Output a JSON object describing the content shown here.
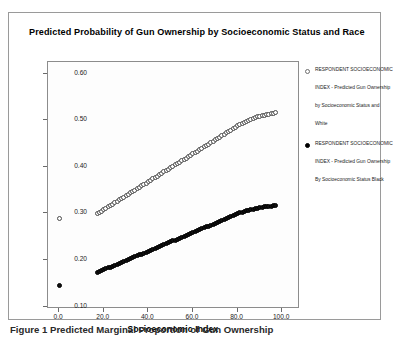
{
  "figure": {
    "title": "Predicted Probability of Gun Ownership by Socioeconomic Status and Race",
    "caption": "Figure 1 Predicted Marginal Proportion of Gun Ownership"
  },
  "legend": {
    "entries": [
      {
        "marker": "open-circle",
        "label": "RESPONDENT SOCIOECONOMIC INDEX - Predicted Gun Ownership by Socioeconomic Status and White"
      },
      {
        "marker": "filled-circle",
        "label": "RESPONDENT SOCIOECONOMIC INDEX - Predicted Gun Ownership By Socioeconomic Status Black"
      }
    ]
  },
  "chart_data": {
    "type": "scatter",
    "title": "Predicted Probability of Gun Ownership by Socioeconomic Status and Race",
    "xlabel": "Socioeconomic Index",
    "ylabel": "",
    "xlim": [
      -5,
      108
    ],
    "ylim": [
      0.095,
      0.625
    ],
    "grid": false,
    "legend_position": "right",
    "xticks": [
      "0.0",
      "20.0",
      "40.0",
      "60.0",
      "80.0",
      "100.0"
    ],
    "xtick_values": [
      0,
      20,
      40,
      60,
      80,
      100
    ],
    "yticks": [
      "0.10",
      "0.20",
      "0.30",
      "0.40",
      "0.50",
      "0.60"
    ],
    "ytick_values": [
      0.1,
      0.2,
      0.3,
      0.4,
      0.5,
      0.6
    ],
    "series": [
      {
        "name": "White - Predicted Gun Ownership by Socioeconomic Status",
        "marker": "open-circle",
        "color": "#ffffff",
        "edge_color": "#4a4a4a",
        "points": [
          [
            0,
            0.29
          ],
          [
            17,
            0.299
          ],
          [
            18,
            0.302
          ],
          [
            19,
            0.305
          ],
          [
            20,
            0.308
          ],
          [
            21,
            0.311
          ],
          [
            22,
            0.314
          ],
          [
            23,
            0.317
          ],
          [
            24,
            0.32
          ],
          [
            25,
            0.323
          ],
          [
            26,
            0.326
          ],
          [
            27,
            0.329
          ],
          [
            28,
            0.332
          ],
          [
            29,
            0.335
          ],
          [
            30,
            0.338
          ],
          [
            31,
            0.341
          ],
          [
            32,
            0.344
          ],
          [
            33,
            0.347
          ],
          [
            34,
            0.35
          ],
          [
            35,
            0.353
          ],
          [
            36,
            0.356
          ],
          [
            37,
            0.359
          ],
          [
            38,
            0.362
          ],
          [
            39,
            0.365
          ],
          [
            40,
            0.368
          ],
          [
            41,
            0.371
          ],
          [
            42,
            0.374
          ],
          [
            43,
            0.377
          ],
          [
            44,
            0.38
          ],
          [
            45,
            0.383
          ],
          [
            46,
            0.386
          ],
          [
            47,
            0.389
          ],
          [
            48,
            0.392
          ],
          [
            49,
            0.395
          ],
          [
            50,
            0.398
          ],
          [
            51,
            0.401
          ],
          [
            52,
            0.404
          ],
          [
            53,
            0.407
          ],
          [
            54,
            0.41
          ],
          [
            55,
            0.413
          ],
          [
            56,
            0.416
          ],
          [
            57,
            0.419
          ],
          [
            58,
            0.422
          ],
          [
            59,
            0.425
          ],
          [
            60,
            0.428
          ],
          [
            61,
            0.431
          ],
          [
            62,
            0.434
          ],
          [
            63,
            0.437
          ],
          [
            64,
            0.44
          ],
          [
            65,
            0.443
          ],
          [
            66,
            0.446
          ],
          [
            67,
            0.449
          ],
          [
            68,
            0.452
          ],
          [
            69,
            0.455
          ],
          [
            70,
            0.458
          ],
          [
            71,
            0.461
          ],
          [
            72,
            0.464
          ],
          [
            73,
            0.467
          ],
          [
            74,
            0.47
          ],
          [
            75,
            0.473
          ],
          [
            76,
            0.476
          ],
          [
            77,
            0.479
          ],
          [
            78,
            0.482
          ],
          [
            79,
            0.485
          ],
          [
            80,
            0.488
          ],
          [
            81,
            0.49
          ],
          [
            82,
            0.493
          ],
          [
            83,
            0.495
          ],
          [
            84,
            0.497
          ],
          [
            85,
            0.499
          ],
          [
            86,
            0.501
          ],
          [
            87,
            0.503
          ],
          [
            88,
            0.505
          ],
          [
            89,
            0.507
          ],
          [
            90,
            0.509
          ],
          [
            91,
            0.51
          ],
          [
            92,
            0.511
          ],
          [
            93,
            0.512
          ],
          [
            94,
            0.513
          ],
          [
            95,
            0.514
          ],
          [
            96,
            0.515
          ],
          [
            97,
            0.516
          ]
        ]
      },
      {
        "name": "Black - Predicted Gun Ownership By Socioeconomic Status",
        "marker": "filled-circle",
        "color": "#111111",
        "edge_color": "#000000",
        "points": [
          [
            0,
            0.145
          ],
          [
            17,
            0.174
          ],
          [
            18,
            0.176
          ],
          [
            19,
            0.178
          ],
          [
            20,
            0.18
          ],
          [
            21,
            0.181
          ],
          [
            22,
            0.183
          ],
          [
            23,
            0.185
          ],
          [
            24,
            0.187
          ],
          [
            25,
            0.189
          ],
          [
            26,
            0.191
          ],
          [
            27,
            0.193
          ],
          [
            28,
            0.195
          ],
          [
            29,
            0.197
          ],
          [
            30,
            0.199
          ],
          [
            31,
            0.201
          ],
          [
            32,
            0.203
          ],
          [
            33,
            0.205
          ],
          [
            34,
            0.207
          ],
          [
            35,
            0.209
          ],
          [
            36,
            0.211
          ],
          [
            37,
            0.213
          ],
          [
            38,
            0.215
          ],
          [
            39,
            0.217
          ],
          [
            40,
            0.219
          ],
          [
            41,
            0.221
          ],
          [
            42,
            0.223
          ],
          [
            43,
            0.225
          ],
          [
            44,
            0.227
          ],
          [
            45,
            0.229
          ],
          [
            46,
            0.231
          ],
          [
            47,
            0.233
          ],
          [
            48,
            0.235
          ],
          [
            49,
            0.237
          ],
          [
            50,
            0.239
          ],
          [
            51,
            0.241
          ],
          [
            52,
            0.243
          ],
          [
            53,
            0.245
          ],
          [
            54,
            0.247
          ],
          [
            55,
            0.249
          ],
          [
            56,
            0.251
          ],
          [
            57,
            0.253
          ],
          [
            58,
            0.255
          ],
          [
            59,
            0.257
          ],
          [
            60,
            0.259
          ],
          [
            61,
            0.261
          ],
          [
            62,
            0.263
          ],
          [
            63,
            0.265
          ],
          [
            64,
            0.267
          ],
          [
            65,
            0.269
          ],
          [
            66,
            0.271
          ],
          [
            67,
            0.273
          ],
          [
            68,
            0.275
          ],
          [
            69,
            0.277
          ],
          [
            70,
            0.279
          ],
          [
            71,
            0.281
          ],
          [
            72,
            0.283
          ],
          [
            73,
            0.285
          ],
          [
            74,
            0.287
          ],
          [
            75,
            0.289
          ],
          [
            76,
            0.291
          ],
          [
            77,
            0.293
          ],
          [
            78,
            0.295
          ],
          [
            79,
            0.297
          ],
          [
            80,
            0.299
          ],
          [
            81,
            0.301
          ],
          [
            82,
            0.303
          ],
          [
            83,
            0.304
          ],
          [
            84,
            0.306
          ],
          [
            85,
            0.307
          ],
          [
            86,
            0.308
          ],
          [
            87,
            0.309
          ],
          [
            88,
            0.31
          ],
          [
            89,
            0.311
          ],
          [
            90,
            0.312
          ],
          [
            91,
            0.313
          ],
          [
            92,
            0.314
          ],
          [
            93,
            0.315
          ],
          [
            94,
            0.316
          ],
          [
            95,
            0.316
          ],
          [
            96,
            0.317
          ],
          [
            97,
            0.318
          ]
        ]
      }
    ]
  }
}
